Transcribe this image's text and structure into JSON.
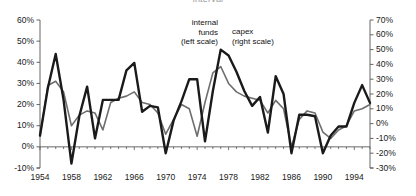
{
  "title": {
    "text": "interval",
    "note": "clipped at top edge of screenshot"
  },
  "annotations": {
    "internal_funds": {
      "line1": "internal",
      "line2": "funds",
      "line3": "(left scale)"
    },
    "capex": {
      "line1": "capex",
      "line2": "(right scale)"
    }
  },
  "axes": {
    "left_ticks": [
      "60%",
      "50%",
      "40%",
      "30%",
      "20%",
      "10%",
      "0%",
      "-10%"
    ],
    "right_ticks": [
      "70%",
      "60%",
      "50%",
      "40%",
      "30%",
      "20%",
      "10%",
      "0%",
      "-10%",
      "-20%",
      "-30%"
    ],
    "x_ticks": [
      "1954",
      "1958",
      "1962",
      "1966",
      "1970",
      "1974",
      "1978",
      "1982",
      "1986",
      "1990",
      "1994"
    ]
  },
  "chart_data": {
    "type": "line",
    "title": "interval",
    "xlabel": "",
    "ylabel": "internal funds (left scale)",
    "y2label": "capex (right scale)",
    "grid": false,
    "legend": "in-plot annotations",
    "xlim": [
      1954,
      1996
    ],
    "ylim": [
      -10,
      60
    ],
    "y2lim": [
      -30,
      70
    ],
    "x": [
      1954,
      1955,
      1956,
      1957,
      1958,
      1959,
      1960,
      1961,
      1962,
      1963,
      1964,
      1965,
      1966,
      1967,
      1968,
      1969,
      1970,
      1971,
      1972,
      1973,
      1974,
      1975,
      1976,
      1977,
      1978,
      1979,
      1980,
      1981,
      1982,
      1983,
      1984,
      1985,
      1986,
      1987,
      1988,
      1989,
      1990,
      1991,
      1992,
      1993,
      1994,
      1995,
      1996
    ],
    "series": [
      {
        "name": "internal funds",
        "axis": "left",
        "color": "#6e6e6e",
        "width": 1.6,
        "units": "percent",
        "values": [
          5,
          29,
          31,
          26,
          10,
          15,
          17,
          16,
          8,
          21,
          23,
          24,
          26,
          21,
          20,
          16,
          6,
          13,
          20,
          18,
          5,
          21,
          35,
          38,
          30,
          26,
          24,
          23,
          22,
          16,
          22,
          18,
          0,
          13,
          17,
          16,
          7,
          4,
          8,
          10,
          17,
          18,
          20
        ]
      },
      {
        "name": "capex",
        "axis": "right",
        "color": "#1a1a1a",
        "width": 2.4,
        "units": "percent",
        "values": [
          -8,
          24,
          47,
          16,
          -27,
          5,
          25,
          -10,
          16,
          16,
          16,
          36,
          41,
          8,
          12,
          11,
          -20,
          2,
          15,
          30,
          30,
          -12,
          22,
          50,
          46,
          35,
          22,
          12,
          18,
          -6,
          32,
          20,
          -20,
          6,
          6,
          5,
          -20,
          -8,
          -2,
          -2,
          14,
          26,
          14
        ]
      }
    ]
  }
}
